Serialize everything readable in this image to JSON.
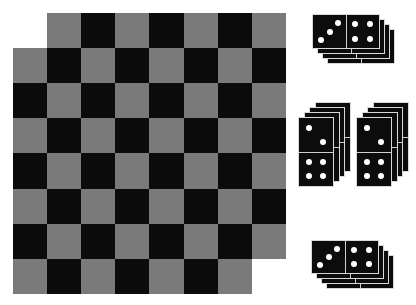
{
  "game": {
    "name": "Checkerboard with domino stacks",
    "board": {
      "rows": 8,
      "cols": 8,
      "origin": {
        "x": 13,
        "y": 13
      },
      "cell_width": 34.1,
      "cell_height": 35.1,
      "missing_cells": [
        [
          0,
          0
        ],
        [
          7,
          7
        ]
      ],
      "colors": {
        "dark": "#0b0b0b",
        "light": "#7a7a7a"
      },
      "dark_parity": "even"
    },
    "domino_stacks": [
      {
        "id": "stack-top",
        "orientation": "horizontal",
        "count": 4,
        "front": {
          "x": 312,
          "y": 14
        },
        "step": {
          "dx": 5,
          "dy": 5
        },
        "width": 68,
        "height": 35,
        "front_values": [
          3,
          4
        ]
      },
      {
        "id": "stack-middle-left",
        "orientation": "vertical",
        "count": 4,
        "front": {
          "x": 298,
          "y": 117
        },
        "step": {
          "dx": 5.5,
          "dy": -5
        },
        "width": 36,
        "height": 70,
        "front_values": [
          2,
          4
        ]
      },
      {
        "id": "stack-middle-right",
        "orientation": "vertical",
        "count": 4,
        "front": {
          "x": 356,
          "y": 117
        },
        "step": {
          "dx": 5.5,
          "dy": -5
        },
        "width": 36,
        "height": 70,
        "front_values": [
          2,
          4
        ]
      },
      {
        "id": "stack-bottom",
        "orientation": "horizontal",
        "count": 4,
        "front": {
          "x": 311,
          "y": 240
        },
        "step": {
          "dx": 5,
          "dy": 5
        },
        "width": 68,
        "height": 34,
        "front_values": [
          3,
          4
        ]
      }
    ],
    "colors": {
      "domino_body": "#0c0c0c",
      "pip": "#ffffff",
      "divider": "#cfcfcf",
      "background": "#ffffff"
    }
  }
}
